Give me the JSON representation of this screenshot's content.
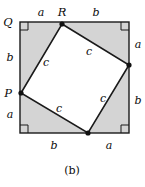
{
  "figure": {
    "caption": "(b)",
    "colors": {
      "shade_fill": "#d4d4d4",
      "inner_fill": "#ffffff",
      "stroke": "#1a1a1a",
      "background": "#ffffff"
    },
    "outer_square": {
      "left": 20,
      "top": 22,
      "right": 129,
      "bottom": 133
    },
    "inner_square_vertices": [
      {
        "name": "R",
        "x": 62,
        "y": 24
      },
      {
        "name": "right",
        "x": 129,
        "y": 65
      },
      {
        "name": "bottom",
        "x": 88,
        "y": 133
      },
      {
        "name": "P",
        "x": 21,
        "y": 93
      }
    ],
    "vertex_labels": [
      {
        "id": "Q",
        "text": "Q",
        "x": 8,
        "y": 22
      },
      {
        "id": "R",
        "text": "R",
        "x": 62,
        "y": 12
      },
      {
        "id": "P",
        "text": "P",
        "x": 8,
        "y": 93
      }
    ],
    "side_labels": [
      {
        "id": "top-left-a",
        "text": "a",
        "x": 41,
        "y": 12
      },
      {
        "id": "top-right-b",
        "text": "b",
        "x": 96,
        "y": 12
      },
      {
        "id": "right-upper-a",
        "text": "a",
        "x": 138,
        "y": 44
      },
      {
        "id": "right-lower-b",
        "text": "b",
        "x": 138,
        "y": 100
      },
      {
        "id": "bottom-left-b",
        "text": "b",
        "x": 54,
        "y": 145
      },
      {
        "id": "bottom-right-a",
        "text": "a",
        "x": 109,
        "y": 145
      },
      {
        "id": "left-upper-b",
        "text": "b",
        "x": 10,
        "y": 57
      },
      {
        "id": "left-lower-a",
        "text": "a",
        "x": 10,
        "y": 114
      }
    ],
    "hypotenuse_labels": [
      {
        "id": "c-top-left",
        "text": "c",
        "x": 46,
        "y": 62
      },
      {
        "id": "c-top-right",
        "text": "c",
        "x": 89,
        "y": 51
      },
      {
        "id": "c-bottom-right",
        "text": "c",
        "x": 103,
        "y": 98
      },
      {
        "id": "c-bottom-left",
        "text": "c",
        "x": 59,
        "y": 108
      }
    ],
    "right_angle_marks": [
      {
        "id": "corner-top-left",
        "x": 20,
        "y": 22,
        "dx": 1,
        "dy": 1
      },
      {
        "id": "corner-top-right",
        "x": 129,
        "y": 22,
        "dx": -1,
        "dy": 1
      },
      {
        "id": "corner-bottom-right",
        "x": 129,
        "y": 133,
        "dx": -1,
        "dy": -1
      },
      {
        "id": "corner-bottom-left",
        "x": 20,
        "y": 133,
        "dx": 1,
        "dy": -1
      }
    ]
  }
}
